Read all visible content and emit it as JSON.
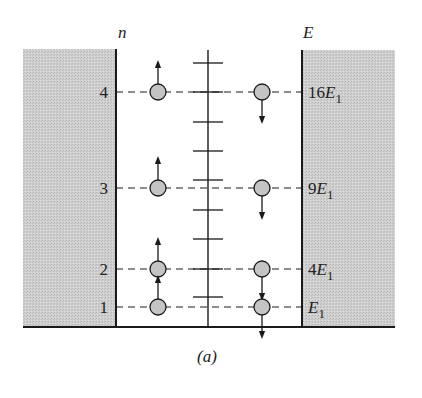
{
  "figure": {
    "caption": "(a)",
    "left_axis_label": "n",
    "right_axis_label": "E",
    "colors": {
      "wall_fill": "#c8c8c8",
      "line": "#1a1a1a",
      "particle_fill": "#c4c4c4",
      "background": "#ffffff"
    }
  },
  "levels": [
    {
      "n": "4",
      "energy_coeff": "16",
      "energy_sym": "E",
      "energy_sub": "1",
      "y": 92,
      "left_spin": "up",
      "right_spin": "down"
    },
    {
      "n": "3",
      "energy_coeff": "9",
      "energy_sym": "E",
      "energy_sub": "1",
      "y": 188,
      "left_spin": "up",
      "right_spin": "down"
    },
    {
      "n": "2",
      "energy_coeff": "4",
      "energy_sym": "E",
      "energy_sub": "1",
      "y": 269,
      "left_spin": "up",
      "right_spin": "down"
    },
    {
      "n": "1",
      "energy_coeff": "",
      "energy_sym": "E",
      "energy_sub": "1",
      "y": 307,
      "left_spin": "up",
      "right_spin": "down"
    }
  ],
  "center_axis_ticks": [
    63,
    92,
    122,
    151,
    180,
    210,
    239,
    269,
    297
  ],
  "geometry": {
    "left_wall_x": 116,
    "right_wall_x": 302,
    "center_axis_x": 208,
    "top_y": 50,
    "bottom_y": 327,
    "left_particle_x": 158,
    "right_particle_x": 262,
    "particle_r": 8
  }
}
